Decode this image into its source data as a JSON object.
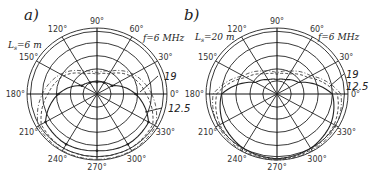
{
  "figure": {
    "panels": [
      {
        "id": "a",
        "label": "a)",
        "length_label": "L",
        "length_sub": "s",
        "length_value": "=6 m",
        "freq_label": "f=6 MHz",
        "curve_labels": [
          "19",
          "12.5"
        ],
        "angle_labels": [
          "0°",
          "30°",
          "60°",
          "90°",
          "120°",
          "150°",
          "180°",
          "210°",
          "240°",
          "270°",
          "300°",
          "330°"
        ]
      },
      {
        "id": "b",
        "label": "b)",
        "length_label": "L",
        "length_sub": "s",
        "length_value": "=20 m",
        "freq_label": "f=6 MHz",
        "curve_labels": [
          "19",
          "12.5"
        ],
        "angle_labels": [
          "0°",
          "30°",
          "60°",
          "90°",
          "120°",
          "150°",
          "180°",
          "210°",
          "240°",
          "270°",
          "300°",
          "330°"
        ]
      }
    ]
  },
  "chart_data": [
    {
      "type": "polar",
      "title": "a) Ls=6 m",
      "annotations": [
        "Ls=6 m",
        "f=6 MHz",
        "19",
        "12.5"
      ],
      "angle_ticks_deg": [
        0,
        30,
        60,
        90,
        120,
        150,
        180,
        210,
        240,
        270,
        300,
        330
      ],
      "radial_rings": 5,
      "series": [
        {
          "name": "f=6 MHz",
          "style": "solid",
          "angles_deg": [
            0,
            30,
            60,
            90,
            120,
            150,
            180,
            210,
            240,
            270,
            300,
            330
          ],
          "r_norm": [
            0.55,
            0.25,
            0.2,
            0.18,
            0.2,
            0.25,
            0.55,
            0.85,
            0.88,
            0.86,
            0.88,
            0.85
          ]
        },
        {
          "name": "19 MHz",
          "style": "dashed",
          "angles_deg": [
            0,
            30,
            60,
            90,
            120,
            150,
            180,
            210,
            240,
            270,
            300,
            330
          ],
          "r_norm": [
            0.7,
            0.55,
            0.35,
            0.3,
            0.35,
            0.55,
            0.7,
            0.92,
            0.95,
            0.95,
            0.95,
            0.92
          ]
        },
        {
          "name": "12.5 MHz",
          "style": "dash-dot",
          "angles_deg": [
            0,
            30,
            60,
            90,
            120,
            150,
            180,
            210,
            240,
            270,
            300,
            330
          ],
          "r_norm": [
            0.78,
            0.6,
            0.4,
            0.32,
            0.4,
            0.6,
            0.78,
            0.97,
            0.99,
            0.99,
            0.99,
            0.97
          ]
        }
      ]
    },
    {
      "type": "polar",
      "title": "b) Ls=20 m",
      "annotations": [
        "Ls=20 m",
        "f=6 MHz",
        "19",
        "12.5"
      ],
      "angle_ticks_deg": [
        0,
        30,
        60,
        90,
        120,
        150,
        180,
        210,
        240,
        270,
        300,
        330
      ],
      "radial_rings": 5,
      "series": [
        {
          "name": "f=6 MHz",
          "style": "solid",
          "angles_deg": [
            0,
            30,
            60,
            90,
            120,
            150,
            180,
            210,
            240,
            270,
            300,
            330
          ],
          "r_norm": [
            0.78,
            0.35,
            0.25,
            0.22,
            0.25,
            0.35,
            0.78,
            0.88,
            0.95,
            0.98,
            0.95,
            0.88
          ]
        },
        {
          "name": "19 MHz",
          "style": "dashed",
          "angles_deg": [
            0,
            30,
            60,
            90,
            120,
            150,
            180,
            210,
            240,
            270,
            300,
            330
          ],
          "r_norm": [
            0.85,
            0.5,
            0.35,
            0.3,
            0.35,
            0.5,
            0.85,
            0.93,
            0.97,
            0.99,
            0.97,
            0.93
          ]
        },
        {
          "name": "12.5 MHz",
          "style": "dash-dot",
          "angles_deg": [
            0,
            30,
            60,
            90,
            120,
            150,
            180,
            210,
            240,
            270,
            300,
            330
          ],
          "r_norm": [
            0.9,
            0.55,
            0.4,
            0.32,
            0.4,
            0.55,
            0.9,
            0.96,
            0.99,
            1.0,
            0.99,
            0.96
          ]
        }
      ]
    }
  ]
}
